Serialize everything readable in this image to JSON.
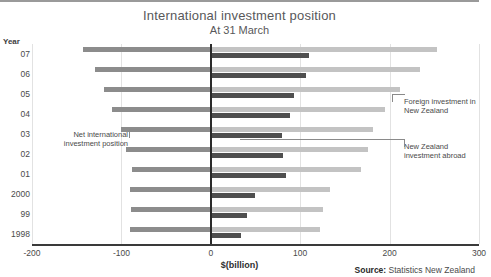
{
  "title": "International investment position",
  "subtitle": "At 31 March",
  "year_header": "Year",
  "source_label": "Source:",
  "source_value": "Statistics New Zealand",
  "annotations": {
    "net": "Net international investment position",
    "foreign": "Foreign investment in New Zealand",
    "abroad": "New Zealand investment abroad"
  },
  "chart_data": {
    "type": "bar",
    "orientation": "horizontal",
    "title": "International investment position",
    "subtitle": "At 31 March",
    "xlabel": "$(billion)",
    "ylabel": "Year",
    "xlim": [
      -200,
      300
    ],
    "xticks": [
      -200,
      -100,
      0,
      100,
      200,
      300
    ],
    "xticklabels": [
      "-200",
      "-100",
      "0",
      "100",
      "200",
      "300"
    ],
    "categories": [
      "07",
      "06",
      "05",
      "04",
      "03",
      "02",
      "01",
      "2000",
      "99",
      "1998"
    ],
    "grid": true,
    "legend": "annotations",
    "series": [
      {
        "name": "Net international investment position",
        "color": "#8c8c8c",
        "values": [
          -143,
          -129,
          -120,
          -110,
          -100,
          -95,
          -88,
          -90,
          -89,
          -90
        ]
      },
      {
        "name": "Foreign investment in New Zealand",
        "color": "#c3c3c3",
        "values": [
          253,
          234,
          212,
          195,
          181,
          176,
          168,
          133,
          126,
          122
        ]
      },
      {
        "name": "New Zealand investment abroad",
        "color": "#4f4f4f",
        "values": [
          110,
          106,
          93,
          89,
          80,
          81,
          84,
          50,
          40,
          34
        ]
      }
    ]
  }
}
